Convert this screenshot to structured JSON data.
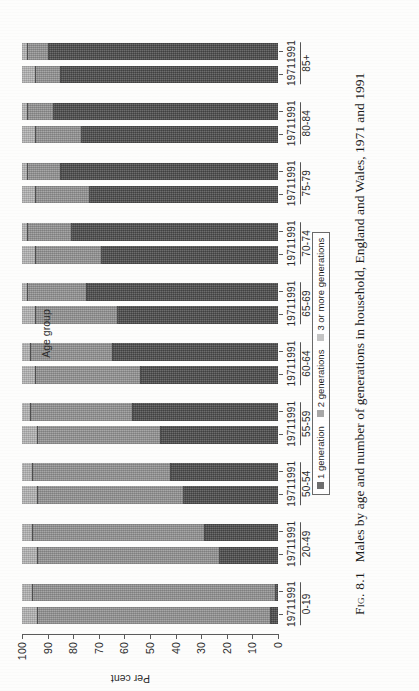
{
  "figure": {
    "number_label": "Fig. 8.1",
    "caption": "Males by age and number of generations in household, England and Wales, 1971 and 1991",
    "caption_full": "Fig. 8.1  Males by age and number of generations in household, England and Wales, 1971 and 1991"
  },
  "axes": {
    "y_label": "Per cent",
    "x_label": "Age group",
    "y_ticks": [
      "0",
      "10",
      "20",
      "30",
      "40",
      "50",
      "60",
      "70",
      "80",
      "90",
      "100"
    ],
    "y_min": 0,
    "y_max": 100
  },
  "legend": {
    "items": [
      {
        "label": "1 generation",
        "color": "#6e6e6e",
        "swatch_name": "legend-swatch-1-generation"
      },
      {
        "label": "2 generations",
        "color": "#a8a8a8",
        "swatch_name": "legend-swatch-2-generations"
      },
      {
        "label": "3 or more generations",
        "color": "#c4c4c4",
        "swatch_name": "legend-swatch-3-or-more-generations"
      }
    ]
  },
  "chart_data": {
    "type": "bar",
    "subtype": "stacked-vertical-grouped",
    "title": "Males by age and number of generations in household, England and Wales, 1971 and 1991",
    "xlabel": "Age group",
    "ylabel": "Per cent",
    "ylim": [
      0,
      100
    ],
    "yticks": [
      0,
      10,
      20,
      30,
      40,
      50,
      60,
      70,
      80,
      90,
      100
    ],
    "grid": false,
    "legend_position": "bottom-center",
    "categories": [
      "0-19",
      "20-49",
      "50-54",
      "55-59",
      "60-64",
      "65-69",
      "70-74",
      "75-79",
      "80-84",
      "85+"
    ],
    "subcategories": [
      "1971",
      "1991"
    ],
    "series": [
      {
        "name": "1 generation",
        "color": "#6e6e6e",
        "values_1971": [
          3,
          23,
          37,
          46,
          54,
          63,
          69,
          74,
          77,
          85
        ],
        "values_1991": [
          1,
          29,
          42,
          57,
          65,
          75,
          81,
          85,
          88,
          90
        ]
      },
      {
        "name": "2 generations",
        "color": "#a8a8a8",
        "values_1971": [
          91,
          71,
          57,
          48,
          41,
          32,
          26,
          21,
          18,
          10
        ],
        "values_1991": [
          95,
          67,
          54,
          40,
          32,
          23,
          17,
          13,
          10,
          8
        ]
      },
      {
        "name": "3 or more generations",
        "color": "#c4c4c4",
        "values_1971": [
          6,
          6,
          6,
          6,
          5,
          5,
          5,
          5,
          5,
          5
        ],
        "values_1991": [
          4,
          4,
          4,
          3,
          3,
          2,
          2,
          2,
          2,
          2
        ]
      }
    ],
    "bars": [
      {
        "group": "0-19",
        "year": "1971",
        "segments": [
          3,
          91,
          6
        ],
        "total": 100
      },
      {
        "group": "0-19",
        "year": "1991",
        "segments": [
          1,
          95,
          4
        ],
        "total": 100
      },
      {
        "group": "20-49",
        "year": "1971",
        "segments": [
          23,
          71,
          6
        ],
        "total": 100
      },
      {
        "group": "20-49",
        "year": "1991",
        "segments": [
          29,
          67,
          4
        ],
        "total": 100
      },
      {
        "group": "50-54",
        "year": "1971",
        "segments": [
          37,
          57,
          6
        ],
        "total": 100
      },
      {
        "group": "50-54",
        "year": "1991",
        "segments": [
          42,
          54,
          4
        ],
        "total": 100
      },
      {
        "group": "55-59",
        "year": "1971",
        "segments": [
          46,
          48,
          6
        ],
        "total": 100
      },
      {
        "group": "55-59",
        "year": "1991",
        "segments": [
          57,
          40,
          3
        ],
        "total": 100
      },
      {
        "group": "60-64",
        "year": "1971",
        "segments": [
          54,
          41,
          5
        ],
        "total": 100
      },
      {
        "group": "60-64",
        "year": "1991",
        "segments": [
          65,
          32,
          3
        ],
        "total": 100
      },
      {
        "group": "65-69",
        "year": "1971",
        "segments": [
          63,
          32,
          5
        ],
        "total": 100
      },
      {
        "group": "65-69",
        "year": "1991",
        "segments": [
          75,
          23,
          2
        ],
        "total": 100
      },
      {
        "group": "70-74",
        "year": "1971",
        "segments": [
          69,
          26,
          5
        ],
        "total": 100
      },
      {
        "group": "70-74",
        "year": "1991",
        "segments": [
          81,
          17,
          2
        ],
        "total": 100
      },
      {
        "group": "75-79",
        "year": "1971",
        "segments": [
          74,
          21,
          5
        ],
        "total": 100
      },
      {
        "group": "75-79",
        "year": "1991",
        "segments": [
          85,
          13,
          2
        ],
        "total": 100
      },
      {
        "group": "80-84",
        "year": "1971",
        "segments": [
          77,
          18,
          5
        ],
        "total": 100
      },
      {
        "group": "80-84",
        "year": "1991",
        "segments": [
          88,
          10,
          2
        ],
        "total": 100
      },
      {
        "group": "85+",
        "year": "1971",
        "segments": [
          85,
          10,
          5
        ],
        "total": 100
      },
      {
        "group": "85+",
        "year": "1991",
        "segments": [
          90,
          8,
          2
        ],
        "total": 100
      }
    ]
  }
}
